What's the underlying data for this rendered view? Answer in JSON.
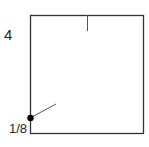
{
  "diagram": {
    "labels": {
      "side": "4",
      "point_fraction": "1/8"
    },
    "square": {
      "x": 30,
      "y": 15,
      "width": 113,
      "height": 118,
      "stroke": "#333333"
    },
    "top_tick": {
      "x": 87,
      "y1": 15,
      "y2": 31
    },
    "point": {
      "x": 30,
      "y": 118,
      "color": "#000000"
    },
    "segment": {
      "x1": 30,
      "y1": 118,
      "x2": 56,
      "y2": 104
    }
  }
}
